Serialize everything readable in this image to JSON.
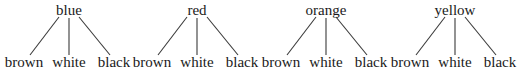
{
  "diagram": {
    "type": "tree-set",
    "trees": [
      {
        "root": "blue",
        "children": [
          "brown",
          "white",
          "black"
        ]
      },
      {
        "root": "red",
        "children": [
          "brown",
          "white",
          "black"
        ]
      },
      {
        "root": "orange",
        "children": [
          "brown",
          "white",
          "black"
        ]
      },
      {
        "root": "yellow",
        "children": [
          "brown",
          "white",
          "black"
        ]
      }
    ]
  }
}
